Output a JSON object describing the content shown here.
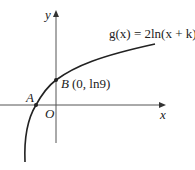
{
  "diagram": {
    "function_label": "g(x) = 2ln(x + k)",
    "axes": {
      "x_label": "x",
      "y_label": "y",
      "origin_label": "O"
    },
    "points": [
      {
        "name": "A",
        "label": "A",
        "description": "x-intercept of curve"
      },
      {
        "name": "B",
        "label": "B",
        "coords": "(0, ln9)",
        "description": "y-intercept of curve"
      }
    ],
    "colors": {
      "curve": "#222222",
      "axes": "#555555"
    }
  }
}
